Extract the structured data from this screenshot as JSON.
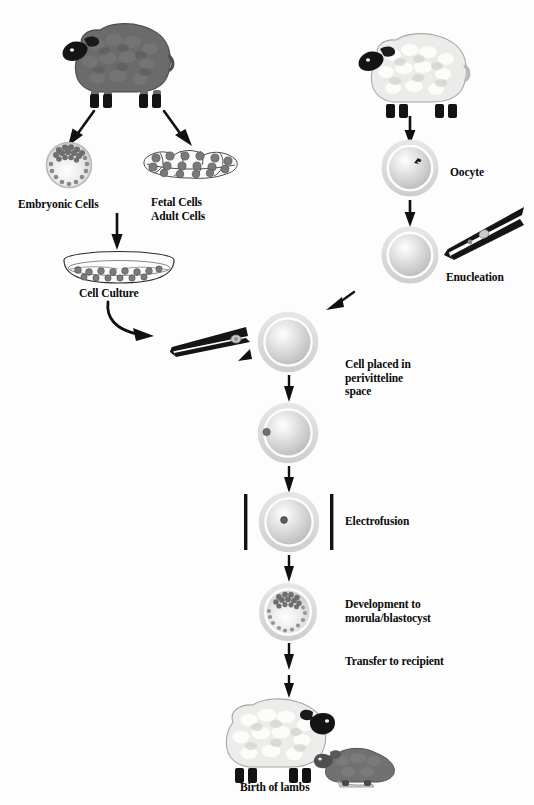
{
  "diagram": {
    "background_color": "#fdfdfd",
    "text_color": "#0a0a0a",
    "donor_sheep_color": "#6b6b6b",
    "recipient_sheep_color": "#e8e8e6",
    "lamb_color": "#717171",
    "cell_fill": "#d8d8d8",
    "zona_color": "#d2d2d2",
    "nucleus_color": "#5a5a5a",
    "electrode_color": "#121212"
  },
  "labels": {
    "embryonic_cells": "Embryonic Cells",
    "fetal_adult_cells": "Fetal Cells\nAdult Cells",
    "cell_culture": "Cell Culture",
    "oocyte": "Oocyte",
    "enucleation": "Enucleation",
    "cell_placed": "Cell placed in\nperivitteline\nspace",
    "electrofusion": "Electrofusion",
    "development": "Development to\nmorula/blastocyst",
    "transfer": "Transfer to recipient",
    "birth": "Birth of lambs"
  },
  "steps": [
    {
      "id": "donor-sheep",
      "name": "Nucleus donor sheep",
      "column": "left"
    },
    {
      "id": "embryonic-cells",
      "name": "Embryonic Cells",
      "column": "left"
    },
    {
      "id": "fetal-adult-cells",
      "name": "Fetal Cells / Adult Cells",
      "column": "left"
    },
    {
      "id": "cell-culture",
      "name": "Cell Culture",
      "column": "left"
    },
    {
      "id": "micropipette-cell",
      "name": "Micropipette holding donor cell",
      "column": "left"
    },
    {
      "id": "oocyte-donor-sheep",
      "name": "Oocyte donor sheep",
      "column": "right"
    },
    {
      "id": "oocyte",
      "name": "Oocyte",
      "column": "right"
    },
    {
      "id": "enucleation",
      "name": "Enucleation",
      "column": "right"
    },
    {
      "id": "cell-placed",
      "name": "Cell placed in perivitteline space",
      "column": "center"
    },
    {
      "id": "electrofusion",
      "name": "Electrofusion",
      "column": "center"
    },
    {
      "id": "development",
      "name": "Development to morula/blastocyst",
      "column": "center"
    },
    {
      "id": "transfer",
      "name": "Transfer to recipient",
      "column": "center"
    },
    {
      "id": "birth",
      "name": "Birth of lambs",
      "column": "center"
    }
  ]
}
